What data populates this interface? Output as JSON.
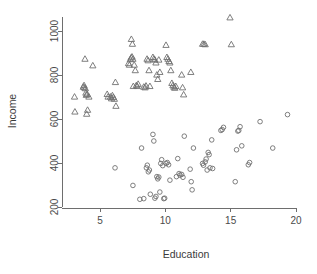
{
  "chart_data": {
    "type": "scatter",
    "title": "",
    "xlabel": "Education",
    "ylabel": "Income",
    "xlim": [
      2.5,
      20.4
    ],
    "ylim": [
      185,
      1090
    ],
    "xticks": [
      5,
      10,
      15,
      20
    ],
    "yticks": [
      200,
      400,
      600,
      800,
      1000
    ],
    "xtick_labels": [
      "5",
      "10",
      "15",
      "20"
    ],
    "ytick_labels": [
      "200",
      "400",
      "600",
      "800",
      "1000"
    ],
    "grid": false,
    "legend": "none",
    "marker_colors": {
      "triangle": "#707070",
      "circle": "#707070"
    },
    "series": [
      {
        "name": "triangle-group",
        "marker": "triangle",
        "points": [
          [
            3.05,
            700
          ],
          [
            3.08,
            632
          ],
          [
            3.72,
            745
          ],
          [
            3.8,
            742
          ],
          [
            3.78,
            752
          ],
          [
            3.88,
            738
          ],
          [
            3.92,
            718
          ],
          [
            3.95,
            708
          ],
          [
            3.85,
            872
          ],
          [
            3.98,
            622
          ],
          [
            4.05,
            640
          ],
          [
            4.02,
            712
          ],
          [
            4.15,
            700
          ],
          [
            4.45,
            842
          ],
          [
            5.55,
            712
          ],
          [
            5.62,
            700
          ],
          [
            5.8,
            700
          ],
          [
            5.88,
            692
          ],
          [
            5.95,
            706
          ],
          [
            6.02,
            698
          ],
          [
            6.1,
            690
          ],
          [
            6.18,
            766
          ],
          [
            6.22,
            658
          ],
          [
            7.18,
            852
          ],
          [
            7.25,
            845
          ],
          [
            7.32,
            870
          ],
          [
            7.38,
            878
          ],
          [
            7.45,
            882
          ],
          [
            7.52,
            872
          ],
          [
            7.4,
            962
          ],
          [
            7.48,
            940
          ],
          [
            7.55,
            748
          ],
          [
            7.62,
            845
          ],
          [
            7.7,
            820
          ],
          [
            7.78,
            752
          ],
          [
            7.85,
            748
          ],
          [
            7.92,
            758
          ],
          [
            8.35,
            745
          ],
          [
            8.45,
            742
          ],
          [
            8.52,
            750
          ],
          [
            8.6,
            872
          ],
          [
            8.68,
            865
          ],
          [
            8.75,
            820
          ],
          [
            8.82,
            748
          ],
          [
            9.05,
            880
          ],
          [
            9.12,
            872
          ],
          [
            9.2,
            868
          ],
          [
            9.28,
            855
          ],
          [
            9.35,
            800
          ],
          [
            9.42,
            780
          ],
          [
            9.5,
            868
          ],
          [
            9.58,
            812
          ],
          [
            10.05,
            935
          ],
          [
            10.12,
            880
          ],
          [
            10.2,
            872
          ],
          [
            10.28,
            862
          ],
          [
            10.35,
            855
          ],
          [
            10.42,
            820
          ],
          [
            10.5,
            762
          ],
          [
            10.58,
            752
          ],
          [
            10.65,
            745
          ],
          [
            10.72,
            740
          ],
          [
            10.8,
            748
          ],
          [
            11.25,
            800
          ],
          [
            11.32,
            742
          ],
          [
            11.4,
            710
          ],
          [
            11.95,
            812
          ],
          [
            12.85,
            940
          ],
          [
            12.95,
            940
          ],
          [
            13.05,
            938
          ],
          [
            14.95,
            1060
          ],
          [
            15.05,
            938
          ]
        ]
      },
      {
        "name": "circle-group",
        "marker": "circle",
        "points": [
          [
            6.15,
            378
          ],
          [
            7.52,
            298
          ],
          [
            8.05,
            235
          ],
          [
            8.18,
            468
          ],
          [
            8.35,
            238
          ],
          [
            8.55,
            378
          ],
          [
            8.62,
            390
          ],
          [
            8.7,
            360
          ],
          [
            8.78,
            368
          ],
          [
            8.85,
            258
          ],
          [
            9.05,
            530
          ],
          [
            9.12,
            500
          ],
          [
            9.2,
            240
          ],
          [
            9.28,
            248
          ],
          [
            9.35,
            338
          ],
          [
            9.42,
            328
          ],
          [
            9.5,
            336
          ],
          [
            9.58,
            268
          ],
          [
            9.65,
            398
          ],
          [
            9.72,
            415
          ],
          [
            9.8,
            388
          ],
          [
            9.88,
            238
          ],
          [
            9.95,
            240
          ],
          [
            10.05,
            398
          ],
          [
            10.15,
            402
          ],
          [
            10.25,
            392
          ],
          [
            10.35,
            322
          ],
          [
            10.85,
            338
          ],
          [
            10.95,
            420
          ],
          [
            11.05,
            352
          ],
          [
            11.12,
            345
          ],
          [
            11.25,
            348
          ],
          [
            11.35,
            335
          ],
          [
            11.45,
            522
          ],
          [
            11.9,
            372
          ],
          [
            11.98,
            315
          ],
          [
            12.05,
            278
          ],
          [
            12.15,
            468
          ],
          [
            12.85,
            398
          ],
          [
            12.92,
            390
          ],
          [
            13.05,
            405
          ],
          [
            13.12,
            418
          ],
          [
            13.2,
            368
          ],
          [
            13.28,
            448
          ],
          [
            13.35,
            438
          ],
          [
            13.42,
            378
          ],
          [
            13.55,
            505
          ],
          [
            13.62,
            375
          ],
          [
            14.25,
            548
          ],
          [
            14.35,
            552
          ],
          [
            14.45,
            562
          ],
          [
            15.35,
            315
          ],
          [
            15.45,
            460
          ],
          [
            15.55,
            545
          ],
          [
            15.62,
            548
          ],
          [
            15.72,
            565
          ],
          [
            15.85,
            478
          ],
          [
            16.35,
            392
          ],
          [
            16.45,
            402
          ],
          [
            17.25,
            588
          ],
          [
            18.22,
            468
          ],
          [
            19.35,
            620
          ]
        ]
      }
    ]
  },
  "geometry": {
    "plot_left": 62,
    "plot_right": 310,
    "plot_top": 14,
    "plot_bottom": 208,
    "x_at_5": 100,
    "x_at_20": 296,
    "y_at_200": 207,
    "y_at_1000": 31
  }
}
